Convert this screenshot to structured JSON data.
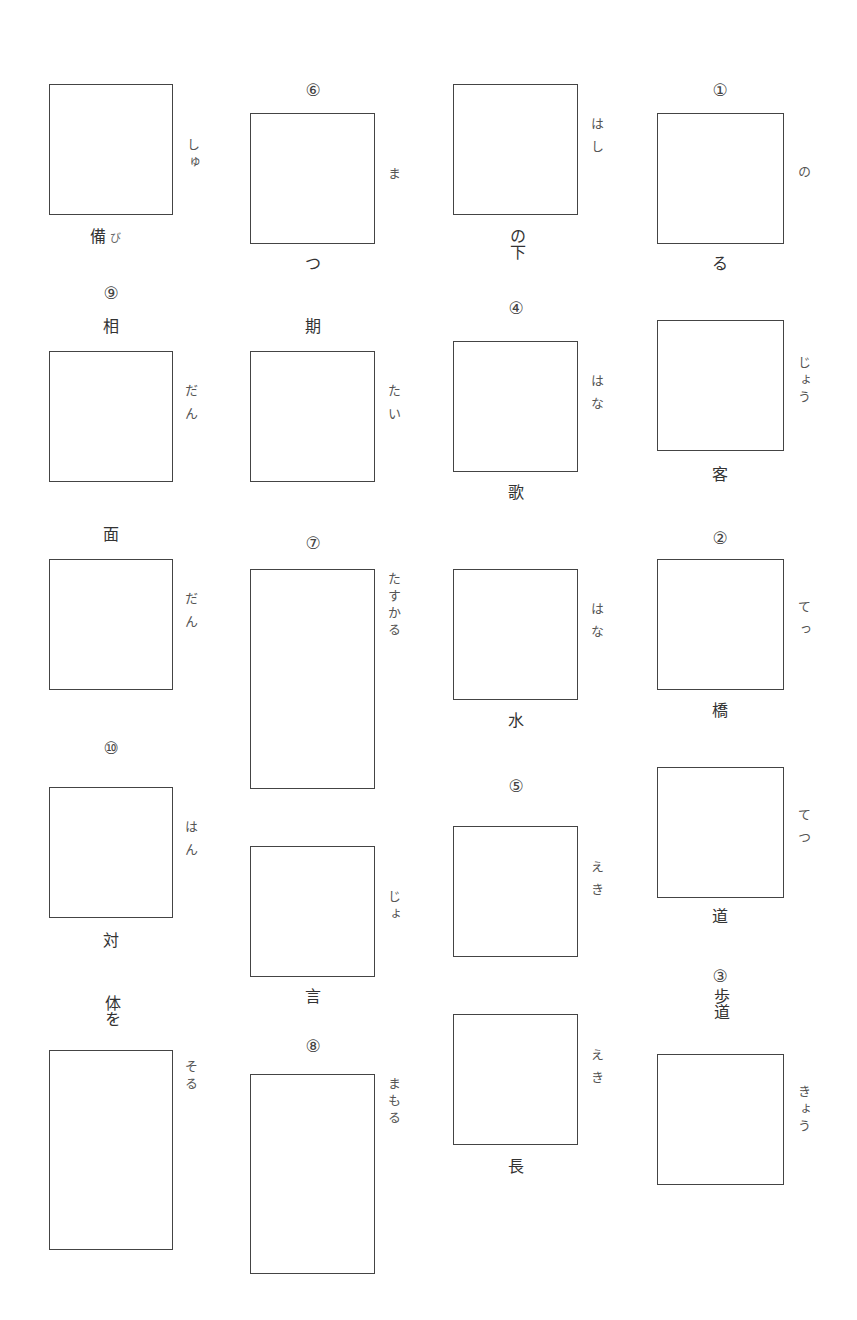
{
  "worksheet": {
    "columns": [
      {
        "cells": [
          {
            "number": "",
            "top_label": "",
            "reading": "しゅ",
            "bottom_label": "備",
            "bottom_suffix": "び"
          },
          {
            "number": "⑨",
            "top_label": "相",
            "reading": "だん",
            "bottom_label": ""
          },
          {
            "number": "",
            "top_label": "面",
            "reading": "だん",
            "bottom_label": ""
          },
          {
            "number": "⑩",
            "top_label": "",
            "reading": "はん",
            "bottom_label": "対"
          },
          {
            "number": "",
            "top_label": "体を",
            "reading": "そる",
            "bottom_label": ""
          }
        ]
      },
      {
        "cells": [
          {
            "number": "⑥",
            "top_label": "",
            "reading": "ま",
            "bottom_label": "つ"
          },
          {
            "number": "",
            "top_label": "期",
            "reading": "たい",
            "bottom_label": ""
          },
          {
            "number": "⑦",
            "top_label": "",
            "reading": "たすかる",
            "bottom_label": ""
          },
          {
            "number": "",
            "top_label": "",
            "reading": "じょ",
            "bottom_label": "言"
          },
          {
            "number": "⑧",
            "top_label": "",
            "reading": "まもる",
            "bottom_label": ""
          }
        ]
      },
      {
        "cells": [
          {
            "number": "",
            "top_label": "",
            "reading": "はし",
            "bottom_label": "の下"
          },
          {
            "number": "④",
            "top_label": "",
            "reading": "はな",
            "bottom_label": "歌"
          },
          {
            "number": "",
            "top_label": "",
            "reading": "はな",
            "bottom_label": "水"
          },
          {
            "number": "⑤",
            "top_label": "",
            "reading": "えき",
            "bottom_label": ""
          },
          {
            "number": "",
            "top_label": "",
            "reading": "えき",
            "bottom_label": "長"
          }
        ]
      },
      {
        "cells": [
          {
            "number": "①",
            "top_label": "",
            "reading": "の",
            "bottom_label": "る"
          },
          {
            "number": "",
            "top_label": "",
            "reading": "じょう",
            "bottom_label": "客"
          },
          {
            "number": "②",
            "top_label": "",
            "reading": "てっ",
            "bottom_label": "橋"
          },
          {
            "number": "",
            "top_label": "",
            "reading": "てつ",
            "bottom_label": "道"
          },
          {
            "number": "③",
            "top_label": "歩道",
            "reading": "きょう",
            "bottom_label": ""
          }
        ]
      }
    ]
  }
}
